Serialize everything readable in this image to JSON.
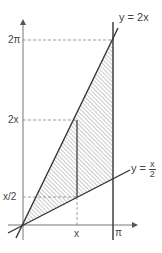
{
  "diagram": {
    "type": "region-between-lines",
    "curves": [
      {
        "label": "y = 2x",
        "equation": "y = 2x"
      },
      {
        "label_prefix": "y =",
        "equation": "y = x/2",
        "frac_num": "x",
        "frac_den": "2"
      }
    ],
    "y_ticks": [
      {
        "label": "2π",
        "value": "2pi"
      },
      {
        "label": "2x",
        "value": "2x"
      },
      {
        "label": "x/2",
        "value": "x/2"
      }
    ],
    "x_ticks": [
      {
        "label": "x",
        "value": "x"
      },
      {
        "label": "π",
        "value": "pi"
      }
    ],
    "shaded_region": "between y = 2x and y = x/2 for 0 ≤ x ≤ π",
    "colors": {
      "stroke": "#333333",
      "hatch": "#555555",
      "dash": "#666666"
    }
  }
}
